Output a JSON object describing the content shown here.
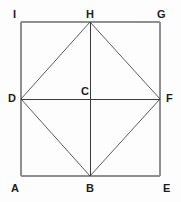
{
  "figure": {
    "width": 181,
    "height": 202,
    "background_color": "#fdfdfd",
    "outline_color": "#8f8f8f",
    "diagonal_color": "#4a4a4a",
    "axis_color": "#3a3a3a",
    "label_color": "#1c1c1c"
  },
  "points": {
    "A": {
      "label": "A",
      "x": 21,
      "y": 176,
      "label_x": 11,
      "label_y": 183,
      "role": "outer-square-bottom-left"
    },
    "E": {
      "label": "E",
      "x": 160,
      "y": 176,
      "label_x": 163,
      "label_y": 183,
      "role": "outer-square-bottom-right"
    },
    "G": {
      "label": "G",
      "x": 160,
      "y": 22,
      "label_x": 157,
      "label_y": 9,
      "role": "outer-square-top-right"
    },
    "I": {
      "label": "I",
      "x": 21,
      "y": 22,
      "label_x": 13,
      "label_y": 9,
      "role": "outer-square-top-left"
    },
    "B": {
      "label": "B",
      "x": 90,
      "y": 176,
      "label_x": 86,
      "label_y": 183,
      "role": "midpoint-bottom"
    },
    "D": {
      "label": "D",
      "x": 21,
      "y": 99,
      "label_x": 8,
      "label_y": 93,
      "role": "midpoint-left"
    },
    "F": {
      "label": "F",
      "x": 160,
      "y": 99,
      "label_x": 166,
      "label_y": 93,
      "role": "midpoint-right"
    },
    "H": {
      "label": "H",
      "x": 90,
      "y": 22,
      "label_x": 86,
      "label_y": 9,
      "role": "midpoint-top"
    },
    "C": {
      "label": "C",
      "x": 90,
      "y": 99,
      "label_x": 81,
      "label_y": 86,
      "role": "center"
    }
  },
  "segments": [
    {
      "name": "outer-top-IG",
      "from": "I",
      "to": "G",
      "style": "outline"
    },
    {
      "name": "outer-right-GE",
      "from": "G",
      "to": "E",
      "style": "outline"
    },
    {
      "name": "outer-bottom-EA",
      "from": "E",
      "to": "A",
      "style": "outline"
    },
    {
      "name": "outer-left-AI",
      "from": "A",
      "to": "I",
      "style": "outline"
    },
    {
      "name": "inner-DH",
      "from": "D",
      "to": "H",
      "style": "diagonal"
    },
    {
      "name": "inner-HF",
      "from": "H",
      "to": "F",
      "style": "diagonal"
    },
    {
      "name": "inner-FB",
      "from": "F",
      "to": "B",
      "style": "diagonal"
    },
    {
      "name": "inner-BD",
      "from": "B",
      "to": "D",
      "style": "diagonal"
    },
    {
      "name": "axis-horizontal-DF",
      "from": "D",
      "to": "F",
      "style": "axis"
    },
    {
      "name": "axis-vertical-HB",
      "from": "H",
      "to": "B",
      "style": "axis"
    }
  ],
  "labels_order": [
    "I",
    "H",
    "G",
    "D",
    "C",
    "F",
    "A",
    "B",
    "E"
  ]
}
